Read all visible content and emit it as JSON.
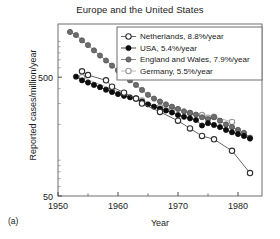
{
  "panel": {
    "label": "(a)"
  },
  "chart_data": {
    "type": "line",
    "title": "Europe and the United States",
    "xlabel": "Year",
    "ylabel": "Reported cases/million/year",
    "xlim": [
      1950,
      1984
    ],
    "ylim": [
      50,
      1400
    ],
    "yscale": "log",
    "xticks": [
      1950,
      1960,
      1970,
      1980
    ],
    "xtick_labels": [
      "1950",
      "1960",
      "1970",
      "1980"
    ],
    "yticks": [
      50,
      500
    ],
    "ytick_labels": [
      "50",
      "500"
    ],
    "grid": false,
    "legend_position": "top-right",
    "series": [
      {
        "name": "Netherlands",
        "legend_label": "Netherlands, 8.8%/year",
        "rate_percent_per_year": 8.8,
        "marker": "open-circle",
        "marker_fill": "#ffffff",
        "marker_edge": "#303030",
        "line_color": "#555555",
        "x": [
          1954,
          1955,
          1958,
          1959,
          1961,
          1963,
          1964,
          1967,
          1970,
          1972,
          1974,
          1976,
          1979,
          1982
        ],
        "y": [
          560,
          520,
          470,
          415,
          370,
          330,
          300,
          255,
          215,
          185,
          160,
          150,
          120,
          78
        ]
      },
      {
        "name": "USA",
        "legend_label": "USA, 5.4%/year",
        "rate_percent_per_year": 5.4,
        "marker": "filled-circle",
        "marker_fill": "#0d0d0d",
        "marker_edge": "#0d0d0d",
        "line_color": "#3a3a3a",
        "x": [
          1953,
          1954,
          1955,
          1956,
          1957,
          1958,
          1959,
          1960,
          1961,
          1962,
          1963,
          1964,
          1965,
          1966,
          1967,
          1968,
          1969,
          1970,
          1971,
          1972,
          1973,
          1974,
          1975,
          1976,
          1977,
          1978,
          1979,
          1980,
          1981,
          1982
        ],
        "y": [
          505,
          470,
          450,
          430,
          412,
          392,
          375,
          360,
          348,
          338,
          330,
          312,
          295,
          282,
          272,
          262,
          252,
          240,
          232,
          225,
          218,
          196,
          205,
          198,
          190,
          180,
          172,
          166,
          160,
          152
        ]
      },
      {
        "name": "England and Wales",
        "legend_label": "England and Wales, 7.9%/year",
        "rate_percent_per_year": 7.9,
        "marker": "filled-circle",
        "marker_fill": "#6e6e6e",
        "marker_edge": "#4a4a4a",
        "line_color": "#7a7a7a",
        "x": [
          1952,
          1953,
          1954,
          1955,
          1956,
          1957,
          1958,
          1959,
          1960,
          1961,
          1962,
          1963,
          1964,
          1965,
          1966,
          1967,
          1968,
          1969,
          1970,
          1971,
          1972,
          1973,
          1974,
          1975,
          1976,
          1977,
          1978,
          1979,
          1980,
          1981,
          1982
        ],
        "y": [
          1200,
          1130,
          1020,
          930,
          840,
          760,
          690,
          625,
          570,
          520,
          470,
          430,
          390,
          355,
          330,
          312,
          295,
          282,
          270,
          258,
          250,
          242,
          230,
          222,
          230,
          215,
          200,
          190,
          180,
          170,
          155
        ]
      },
      {
        "name": "Germany",
        "legend_label": "Germany, 5.5%/year",
        "rate_percent_per_year": 5.5,
        "marker": "open-circle",
        "marker_fill": "#ffffff",
        "marker_edge": "#9a9a9a",
        "line_color": "#b0b0b0",
        "x": [
          1954,
          1959,
          1963,
          1964,
          1967,
          1969,
          1972,
          1974,
          1975,
          1976,
          1979
        ],
        "y": [
          500,
          395,
          330,
          318,
          280,
          272,
          250,
          240,
          228,
          232,
          210
        ]
      }
    ]
  }
}
